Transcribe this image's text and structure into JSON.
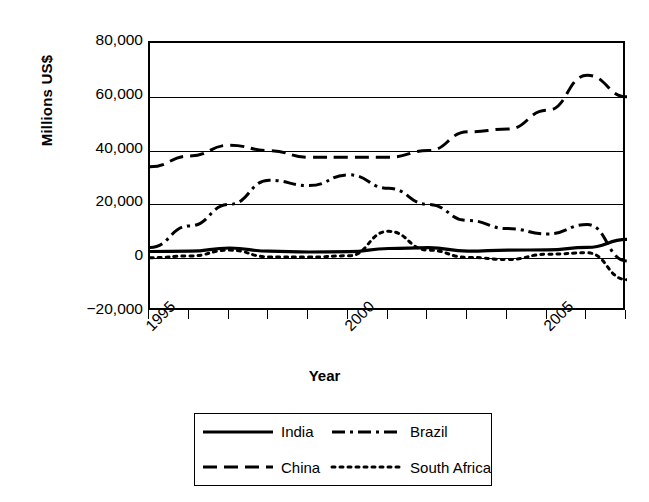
{
  "chart_data": {
    "type": "line",
    "title": "",
    "xlabel": "Year",
    "ylabel": "Millions US$",
    "ylim": [
      -20000,
      80000
    ],
    "xlim": [
      1995,
      2007
    ],
    "grid": true,
    "legend_position": "bottom",
    "y_ticks": [
      "80,000",
      "60,000",
      "40,000",
      "20,000",
      "0",
      "−20,000"
    ],
    "y_tick_values": [
      80000,
      60000,
      40000,
      20000,
      0,
      -20000
    ],
    "x_ticks": [
      1995,
      1996,
      1997,
      1998,
      1999,
      2000,
      2001,
      2002,
      2003,
      2004,
      2005,
      2006,
      2007
    ],
    "x_tick_labels": [
      "1995",
      "",
      "",
      "",
      "",
      "2000",
      "",
      "",
      "",
      "",
      "2005",
      "",
      ""
    ],
    "x": [
      1995,
      1996,
      1997,
      1998,
      1999,
      2000,
      2001,
      2002,
      2003,
      2004,
      2005,
      2006,
      2007
    ],
    "series": [
      {
        "name": "India",
        "dash": "solid",
        "values": [
          2500,
          2600,
          3800,
          2600,
          2300,
          2400,
          3600,
          3900,
          2600,
          3000,
          3100,
          4000,
          7000
        ]
      },
      {
        "name": "China",
        "dash": "long-dash",
        "values": [
          34000,
          38000,
          42000,
          40000,
          37500,
          37500,
          37500,
          40000,
          47000,
          48000,
          55000,
          68000,
          60000
        ]
      },
      {
        "name": "Brazil",
        "dash": "dash-dot",
        "values": [
          4000,
          12000,
          20000,
          29000,
          27000,
          31000,
          26000,
          20000,
          14000,
          11000,
          9000,
          12500,
          -1000
        ]
      },
      {
        "name": "South Africa",
        "dash": "dotted",
        "values": [
          200,
          800,
          3000,
          500,
          400,
          900,
          10000,
          3000,
          300,
          -500,
          1500,
          2000,
          -8000
        ]
      }
    ]
  },
  "axis": {
    "y_title": "Millions US$",
    "x_title": "Year"
  },
  "legend": {
    "items": [
      {
        "label": "India",
        "dash": "solid"
      },
      {
        "label": "Brazil",
        "dash": "dash-dot"
      },
      {
        "label": "China",
        "dash": "long-dash"
      },
      {
        "label": "South Africa",
        "dash": "dotted"
      }
    ]
  },
  "colors": {
    "line": "#000000",
    "grid": "#000000",
    "background": "#ffffff"
  }
}
